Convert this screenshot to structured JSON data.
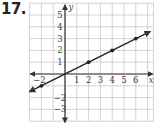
{
  "problem": {
    "number": "17."
  },
  "chart_data": {
    "type": "line",
    "title": "",
    "xlabel": "x",
    "ylabel": "y",
    "xlim": [
      -3,
      7.5
    ],
    "ylim": [
      -4,
      6
    ],
    "grid": true,
    "x_tick_labels": [
      "-2",
      "1",
      "2",
      "3",
      "4",
      "5",
      "6"
    ],
    "y_tick_labels": [
      "5",
      "4",
      "3",
      "2",
      "1",
      "-2",
      "-3"
    ],
    "series": [
      {
        "name": "line",
        "equation": "y = 0.5x",
        "points": [
          [
            -2,
            -1
          ],
          [
            2,
            1
          ],
          [
            4,
            2
          ],
          [
            6,
            3
          ]
        ],
        "arrows": "both"
      }
    ]
  },
  "colors": {
    "grid": "#c8c8c8",
    "axis": "#333333",
    "line": "#222222"
  }
}
